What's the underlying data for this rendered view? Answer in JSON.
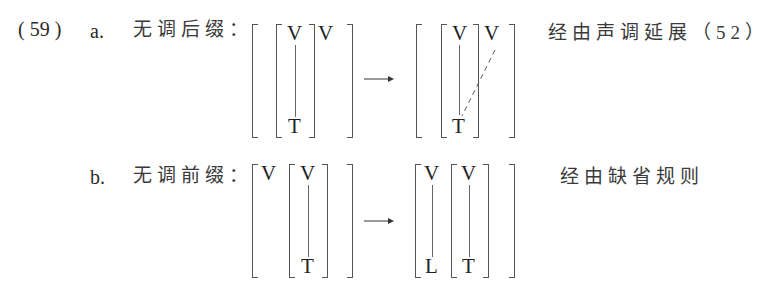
{
  "example": {
    "number": "( 59 )",
    "items": [
      {
        "marker": "a.",
        "title": "无调后缀：",
        "input": {
          "outer": [
            "V-with-T",
            "V"
          ],
          "inner_top": "V",
          "inner_bottom": "T",
          "free": "V"
        },
        "output": {
          "inner_top": "V",
          "inner_bottom": "T",
          "free": "V",
          "association": "dashed line from free V to T"
        },
        "arrow": "→",
        "note": "经由声调延展（52）"
      },
      {
        "marker": "b.",
        "title": "无调前缀：",
        "input": {
          "free": "V",
          "inner_top": "V",
          "inner_bottom": "T"
        },
        "output": {
          "left_top": "V",
          "left_bottom": "L",
          "inner_top": "V",
          "inner_bottom": "T"
        },
        "arrow": "→",
        "note": "经由缺省规则"
      }
    ]
  },
  "symbols": {
    "V": "V",
    "T": "T",
    "L": "L"
  }
}
